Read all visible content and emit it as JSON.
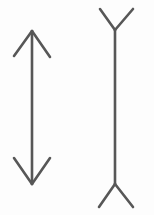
{
  "figure": {
    "type": "line-drawing",
    "background_color": "#fdfdfd",
    "stroke_color": "#575757",
    "stroke_width": 2.6,
    "canvas": {
      "width": 154,
      "height": 215
    },
    "shapes": [
      {
        "name": "left-arrow-inward-fins",
        "description": "Vertical shaft with arrowhead fins pointing inward (double-headed arrow)",
        "shaft": {
          "x1": 32,
          "y1": 31,
          "x2": 32,
          "y2": 184
        },
        "fins": [
          {
            "name": "top-left-fin",
            "x1": 32,
            "y1": 31,
            "x2": 14,
            "y2": 56
          },
          {
            "name": "top-right-fin",
            "x1": 32,
            "y1": 31,
            "x2": 50,
            "y2": 57
          },
          {
            "name": "bottom-left-fin",
            "x1": 32,
            "y1": 184,
            "x2": 14,
            "y2": 158
          },
          {
            "name": "bottom-right-fin",
            "x1": 32,
            "y1": 184,
            "x2": 50,
            "y2": 158
          }
        ],
        "shaft_length_px": 153
      },
      {
        "name": "right-line-outward-fins",
        "description": "Vertical shaft with fins pointing outward (Y at top, inverted Y at bottom)",
        "shaft": {
          "x1": 115,
          "y1": 30,
          "x2": 115,
          "y2": 184
        },
        "fins": [
          {
            "name": "top-left-fin",
            "x1": 115,
            "y1": 30,
            "x2": 100,
            "y2": 9
          },
          {
            "name": "top-right-fin",
            "x1": 115,
            "y1": 30,
            "x2": 133,
            "y2": 9
          },
          {
            "name": "bottom-left-fin",
            "x1": 115,
            "y1": 184,
            "x2": 99,
            "y2": 207
          },
          {
            "name": "bottom-right-fin",
            "x1": 115,
            "y1": 184,
            "x2": 133,
            "y2": 207
          }
        ],
        "shaft_length_px": 154
      }
    ]
  }
}
